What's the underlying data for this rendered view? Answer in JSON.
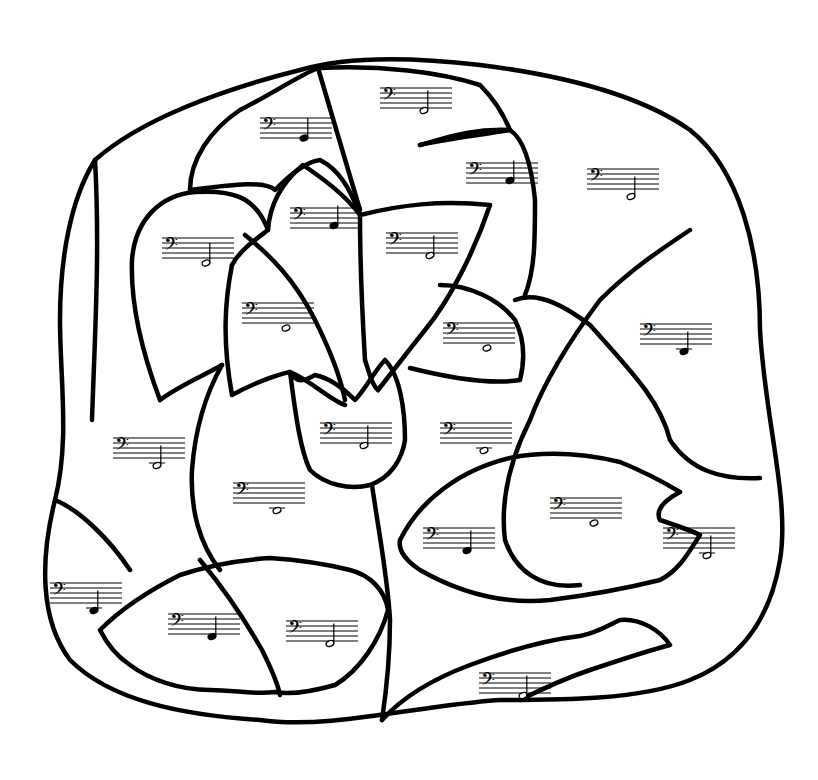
{
  "worksheet": {
    "description": "Bass clef color-by-note coloring page of a flower with leaves",
    "clef": "bass",
    "colors": {
      "line": "#000000",
      "paper": "#ffffff"
    }
  },
  "staves": [
    {
      "id": "s1",
      "x": 380,
      "y": 82,
      "note": "half",
      "pos": 9,
      "region": "top-center-petal"
    },
    {
      "id": "s2",
      "x": 260,
      "y": 112,
      "note": "quarter",
      "pos": 8,
      "region": "upper-left-petal"
    },
    {
      "id": "s3",
      "x": 466,
      "y": 157,
      "note": "quarter",
      "pos": 7,
      "region": "upper-right-petal"
    },
    {
      "id": "s4",
      "x": 587,
      "y": 163,
      "note": "half",
      "pos": 11,
      "region": "right-background"
    },
    {
      "id": "s5",
      "x": 162,
      "y": 232,
      "note": "half",
      "pos": 10,
      "region": "left-petal"
    },
    {
      "id": "s6",
      "x": 290,
      "y": 202,
      "note": "quarter",
      "pos": 7,
      "region": "center-left-petal"
    },
    {
      "id": "s7",
      "x": 386,
      "y": 227,
      "note": "half",
      "pos": 9,
      "region": "center-right-petal"
    },
    {
      "id": "s8",
      "x": 242,
      "y": 297,
      "note": "whole",
      "pos": 10,
      "region": "inner-left-petal"
    },
    {
      "id": "s9",
      "x": 443,
      "y": 317,
      "note": "whole",
      "pos": 10,
      "region": "inner-right-petal"
    },
    {
      "id": "s10",
      "x": 640,
      "y": 318,
      "note": "quarter-ledger",
      "pos": 11,
      "region": "far-right-background"
    },
    {
      "id": "s11",
      "x": 113,
      "y": 432,
      "note": "half-ledger",
      "pos": 11,
      "region": "left-background"
    },
    {
      "id": "s12",
      "x": 320,
      "y": 417,
      "note": "half",
      "pos": 9,
      "region": "tulip-center"
    },
    {
      "id": "s13",
      "x": 440,
      "y": 417,
      "note": "whole-ledger",
      "pos": 11,
      "region": "center-background"
    },
    {
      "id": "s14",
      "x": 233,
      "y": 477,
      "note": "whole-ledger",
      "pos": 11,
      "region": "left-stem-area"
    },
    {
      "id": "s15",
      "x": 550,
      "y": 492,
      "note": "whole",
      "pos": 10,
      "region": "right-leaf"
    },
    {
      "id": "s16",
      "x": 663,
      "y": 522,
      "note": "half-ledger",
      "pos": 11,
      "region": "right-leaf-tip"
    },
    {
      "id": "s17",
      "x": 423,
      "y": 522,
      "note": "quarter",
      "pos": 9,
      "region": "right-leaf-base"
    },
    {
      "id": "s18",
      "x": 50,
      "y": 577,
      "note": "quarter-ledger",
      "pos": 11,
      "region": "bottom-left-background"
    },
    {
      "id": "s19",
      "x": 168,
      "y": 608,
      "note": "quarter",
      "pos": 9,
      "region": "lower-left-leaf"
    },
    {
      "id": "s20",
      "x": 286,
      "y": 615,
      "note": "half",
      "pos": 9,
      "region": "lower-center-leaf"
    },
    {
      "id": "s21",
      "x": 479,
      "y": 667,
      "note": "half",
      "pos": 9,
      "region": "bottom-right-leaf"
    }
  ]
}
